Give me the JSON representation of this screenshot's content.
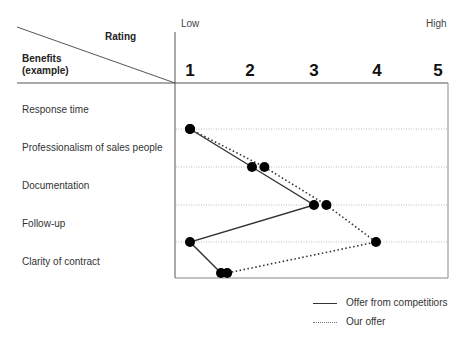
{
  "chart": {
    "header_rating": "Rating",
    "header_benefits_line1": "Benefits",
    "header_benefits_line2": "(example)",
    "scale_low": "Low",
    "scale_high": "High",
    "ticks": [
      "1",
      "2",
      "3",
      "4",
      "5"
    ],
    "legend": {
      "competitors": "Offer from competitiors",
      "ours": "Our offer"
    }
  },
  "chart_data": {
    "type": "line",
    "title": "",
    "xlabel": "Rating",
    "ylabel": "Benefits (example)",
    "x_axis_ends": [
      "Low",
      "High"
    ],
    "xlim": [
      1,
      5
    ],
    "x_ticks": [
      1,
      2,
      3,
      4,
      5
    ],
    "categories": [
      "Response time",
      "Professionalism of sales people",
      "Documentation",
      "Follow-up",
      "Clarity of contract"
    ],
    "series": [
      {
        "name": "Offer from competitiors",
        "style": "solid",
        "values": [
          1,
          2,
          3,
          1,
          1.5
        ]
      },
      {
        "name": "Our offer",
        "style": "dotted",
        "values": [
          1,
          2.2,
          3.2,
          4,
          1.6
        ]
      }
    ],
    "grid": "horizontal dotted",
    "legend_position": "bottom-right",
    "colors": {
      "line": "#333333",
      "marker": "#000000",
      "grid": "#aaaaaa",
      "frame": "#888888"
    }
  }
}
